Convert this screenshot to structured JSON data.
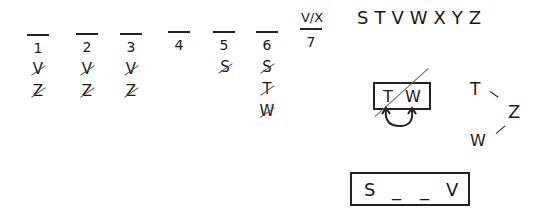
{
  "slots": [
    {
      "label": "1",
      "candidates": [
        {
          "letter": "V",
          "struck": true
        },
        {
          "letter": "Z",
          "struck": true
        }
      ]
    },
    {
      "label": "2",
      "candidates": [
        {
          "letter": "V",
          "struck": true
        },
        {
          "letter": "Z",
          "struck": true
        }
      ]
    },
    {
      "label": "3",
      "candidates": [
        {
          "letter": "V",
          "struck": true
        },
        {
          "letter": "Z",
          "struck": true
        }
      ]
    },
    {
      "label": "4",
      "candidates": []
    },
    {
      "label": "5",
      "candidates": [
        {
          "letter": "S",
          "struck": true
        }
      ]
    },
    {
      "label": "6",
      "candidates": [
        {
          "letter": "S",
          "struck": true
        },
        {
          "letter": "T",
          "struck": true
        },
        {
          "letter": "W",
          "struck": true
        }
      ]
    },
    {
      "label": "7",
      "filled": "V/X",
      "candidates": []
    }
  ],
  "letters": "STVWXYZ",
  "tw_block": {
    "left": "T",
    "right": "W",
    "crossed_out": true,
    "swap_arrow": true
  },
  "triangle": {
    "top": "T",
    "right": "Z",
    "bottom": "W"
  },
  "sv_block": {
    "first": "S",
    "blank1": "_",
    "blank2": "_",
    "last": "V"
  }
}
